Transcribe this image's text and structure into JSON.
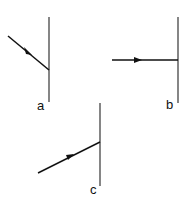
{
  "diagram": {
    "panels": [
      {
        "label": "a",
        "description": "ray incident obliquely from upper left onto vertical surface"
      },
      {
        "label": "b",
        "description": "ray incident perpendicular (horizontal) onto vertical surface"
      },
      {
        "label": "c",
        "description": "ray incident obliquely from lower left onto vertical surface"
      }
    ],
    "colors": {
      "line": "#111111",
      "background": "#ffffff"
    }
  }
}
